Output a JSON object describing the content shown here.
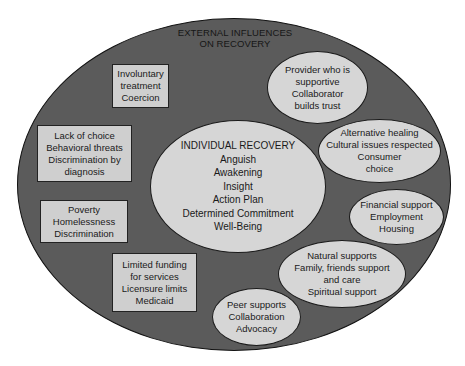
{
  "diagram": {
    "outer": {
      "title_lines": [
        "EXTERNAL INFLUENCES",
        "ON RECOVERY"
      ],
      "fill": "#5b5b5b"
    },
    "center": {
      "lines": [
        "INDIVIDUAL RECOVERY",
        "Anguish",
        "Awakening",
        "Insight",
        "Action Plan",
        "Determined Commitment",
        "Well-Being"
      ],
      "fill": "#d6d6d6"
    },
    "negative_influences": [
      {
        "shape": "rectangle",
        "lines": [
          "Involuntary",
          "treatment",
          "Coercion"
        ]
      },
      {
        "shape": "rectangle",
        "lines": [
          "Lack of choice",
          "Behavioral threats",
          "Discrimination by",
          "diagnosis"
        ]
      },
      {
        "shape": "rectangle",
        "lines": [
          "Poverty",
          "Homelessness",
          "Discrimination"
        ]
      },
      {
        "shape": "rectangle",
        "lines": [
          "Limited funding",
          "for services",
          "Licensure limits",
          "Medicaid"
        ]
      }
    ],
    "positive_influences": [
      {
        "shape": "ellipse",
        "lines": [
          "Provider who is",
          "supportive",
          "Collaborator",
          "builds trust"
        ]
      },
      {
        "shape": "ellipse",
        "lines": [
          "Alternative healing",
          "Cultural issues respected",
          "Consumer",
          "choice"
        ]
      },
      {
        "shape": "ellipse",
        "lines": [
          "Financial support",
          "Employment",
          "Housing"
        ]
      },
      {
        "shape": "ellipse",
        "lines": [
          "Natural supports",
          "Family, friends support",
          "and care",
          "Spiritual support"
        ]
      },
      {
        "shape": "ellipse",
        "lines": [
          "Peer supports",
          "Collaboration",
          "Advocacy"
        ]
      }
    ],
    "colors": {
      "outer_fill": "#5b5b5b",
      "inner_fill": "#d6d6d6",
      "box_fill": "#cfcfcf",
      "outline": "#1a1a1a",
      "text": "#1a1a1a"
    }
  }
}
